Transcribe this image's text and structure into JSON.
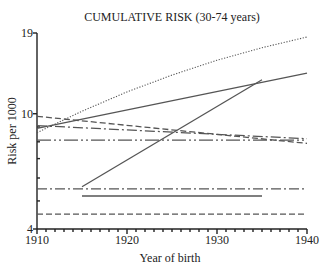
{
  "chart_data": {
    "type": "line",
    "title": "CUMULATIVE RISK (30-74 years)",
    "xlabel": "Year of birth",
    "ylabel": "Risk per 1000",
    "xlim": [
      1910,
      1940
    ],
    "ylim": [
      4,
      19
    ],
    "yscale": "log",
    "x_ticks": [
      "1910",
      "1920",
      "1930",
      "1940"
    ],
    "y_tick_labels": [
      "19",
      "10",
      "4"
    ],
    "y_minor_ticks": [
      9,
      8,
      7,
      6,
      5
    ],
    "grid": false,
    "legend": null,
    "series": [
      {
        "name": "dotted",
        "style": "dotted",
        "x": [
          1910,
          1915,
          1920,
          1925,
          1930,
          1935,
          1940
        ],
        "values": [
          8.6,
          10.2,
          11.9,
          13.6,
          15.3,
          16.9,
          18.4
        ]
      },
      {
        "name": "solid-upper",
        "style": "solid",
        "x": [
          1910,
          1940
        ],
        "values": [
          8.9,
          13.8
        ]
      },
      {
        "name": "long-dash-upper",
        "style": "dashed",
        "x": [
          1910,
          1940
        ],
        "values": [
          9.8,
          7.9
        ]
      },
      {
        "name": "dash-dot-upper",
        "style": "dashdot",
        "x": [
          1910,
          1940
        ],
        "values": [
          9.1,
          8.2
        ]
      },
      {
        "name": "dash-dot-dot",
        "style": "dashdotdot",
        "x": [
          1910,
          1940
        ],
        "values": [
          8.1,
          8.1
        ]
      },
      {
        "name": "solid-diagonal",
        "style": "solid",
        "x": [
          1915,
          1935
        ],
        "values": [
          5.6,
          13.1
        ]
      },
      {
        "name": "dash-dot-lower",
        "style": "dashdot",
        "x": [
          1910,
          1940
        ],
        "values": [
          5.5,
          5.5
        ]
      },
      {
        "name": "solid-short-lower",
        "style": "solid",
        "x": [
          1915,
          1935
        ],
        "values": [
          5.2,
          5.2
        ]
      },
      {
        "name": "dashed-lower",
        "style": "dashed",
        "x": [
          1910,
          1940
        ],
        "values": [
          4.5,
          4.5
        ]
      }
    ]
  },
  "labels": {
    "title": "CUMULATIVE RISK (30-74 years)",
    "xlabel": "Year of birth",
    "ylabel": "Risk per 1000",
    "xticks": [
      "1910",
      "1920",
      "1930",
      "1940"
    ],
    "yticks": [
      "19",
      "10",
      "4"
    ]
  }
}
